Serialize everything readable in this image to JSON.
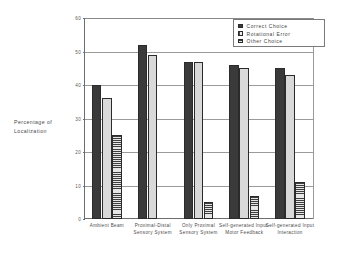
{
  "chart_data": {
    "type": "bar",
    "title": "",
    "xlabel": "",
    "ylabel": "Percentage of Localization",
    "ylim": [
      0,
      60
    ],
    "yticks": [
      0,
      10,
      20,
      30,
      40,
      50,
      60
    ],
    "ytick_labels": [
      "0",
      "10",
      "20",
      "30",
      "40",
      "50",
      "60"
    ],
    "grid": true,
    "legend_position": "top-right",
    "categories": [
      "Ambient Beam",
      "Proximal-Distal Sensory System",
      "Only Proximal Sensory System",
      "Self-generated Input-Motor Feedback",
      "Self-generated Input Interaction"
    ],
    "series": [
      {
        "name": "Correct Choice",
        "values": [
          40,
          52,
          47,
          46,
          45
        ]
      },
      {
        "name": "Rotational Error",
        "values": [
          36,
          49,
          47,
          45,
          43
        ]
      },
      {
        "name": "Other Choice",
        "values": [
          25,
          0,
          5,
          7,
          11
        ]
      }
    ]
  },
  "legend": {
    "items": [
      {
        "label": "Correct Choice",
        "swatch": "correct"
      },
      {
        "label": "Rotational Error",
        "swatch": "rot"
      },
      {
        "label": "Other Choice",
        "swatch": "other"
      }
    ]
  },
  "axis": {
    "y_title_line1": "Percentage of",
    "y_title_line2": "Localization"
  }
}
